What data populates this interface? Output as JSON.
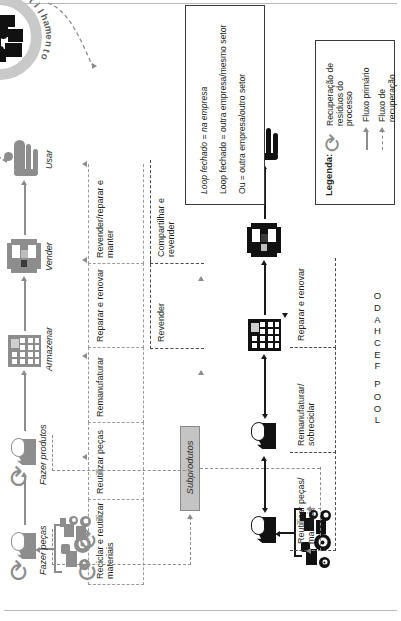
{
  "figure": {
    "title_axis_labels": [
      "LOOP FECHADO",
      "LOOP ABERTO"
    ],
    "platform": {
      "label": "Plataforma de compartilhamento",
      "icon": "people-group-icon"
    },
    "byproducts": {
      "label": "Subprodutos"
    },
    "closed_loop": {
      "name": "LOOP FECHADO",
      "nodes": [
        {
          "id": "maquinas",
          "label": "",
          "icon": "tractor-truck-icon"
        },
        {
          "id": "fazer-pecas",
          "label": "Fazer peças",
          "icon": "factory-icon"
        },
        {
          "id": "fazer-produtos",
          "label": "Fazer produtos",
          "icon": "factory-icon"
        },
        {
          "id": "armazenar",
          "label": "Armazenar",
          "icon": "warehouse-icon"
        },
        {
          "id": "vender",
          "label": "Vender",
          "icon": "shop-icon"
        },
        {
          "id": "usar",
          "label": "Usar",
          "icon": "person-icon"
        }
      ],
      "recovery_labels": [
        "Reciclar e reutilizar materiais",
        "Reutilizar peças",
        "Remanufaturar",
        "Reparar e renovar",
        "Revender/reparar e manter"
      ]
    },
    "open_loop": {
      "name": "LOOP ABERTO",
      "nodes": [
        {
          "id": "maquinas-2",
          "label": "",
          "icon": "tractor-truck-icon"
        },
        {
          "id": "fazer-pecas-2",
          "label": "",
          "icon": "factory-icon"
        },
        {
          "id": "fazer-produtos-2",
          "label": "",
          "icon": "factory-icon"
        },
        {
          "id": "armazenar-2",
          "label": "",
          "icon": "warehouse-icon"
        },
        {
          "id": "vender-2",
          "label": "",
          "icon": "shop-icon"
        },
        {
          "id": "usar-2",
          "label": "",
          "icon": "person-icon"
        }
      ],
      "recovery_labels": [
        "Reutilizar peças/ materiais",
        "Remanufaturar/ sobreciclar",
        "Reparar e renovar",
        "Revender",
        "Compartilhar e revender"
      ]
    },
    "legend": {
      "title": "Legenda:",
      "items": [
        {
          "icon": "recycle-arrow-icon",
          "label": "Recuperação de resíduos do processo"
        },
        {
          "icon": "solid-arrow-icon",
          "label": "Fluxo primário"
        },
        {
          "icon": "dashed-arrow-icon",
          "label": "Fluxo de recuperação"
        }
      ],
      "notes": [
        "Loop fechado = na empresa",
        "Loop fechado = outra empresa/mesmo setor",
        "Ou = outra empresa/outro setor"
      ]
    },
    "colors": {
      "closed_loop_gray": "#8d8d8d",
      "open_loop_black": "#111111",
      "byproducts_fill": "#c4c4c4",
      "platform_ring": "#c9c9c9",
      "text": "#231f20"
    }
  }
}
